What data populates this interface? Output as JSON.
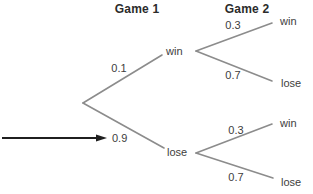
{
  "colors": {
    "background": "#ffffff",
    "line": "#8c8c8c",
    "arrow": "#1f1f1f",
    "header_text": "#2b2b2b",
    "label_text": "#3d3d3d"
  },
  "headers": {
    "game1": "Game 1",
    "game2": "Game 2"
  },
  "tree": {
    "game1": {
      "win": {
        "prob": "0.1",
        "label": "win"
      },
      "lose": {
        "prob": "0.9",
        "label": "lose"
      }
    },
    "game2_after_win": {
      "win": {
        "prob": "0.3",
        "label": "win"
      },
      "lose": {
        "prob": "0.7",
        "label": "lose"
      }
    },
    "game2_after_lose": {
      "win": {
        "prob": "0.3",
        "label": "win"
      },
      "lose": {
        "prob": "0.7",
        "label": "lose"
      }
    }
  }
}
